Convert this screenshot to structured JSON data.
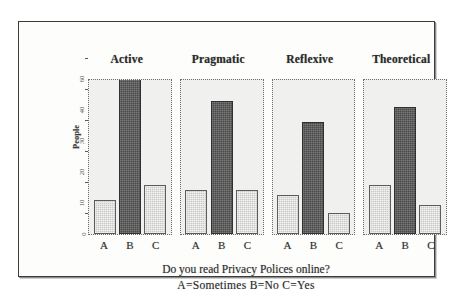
{
  "chart_data": {
    "type": "bar",
    "title": "",
    "panels": [
      "Active",
      "Pragmatic",
      "Reflexive",
      "Theoretical"
    ],
    "categories": [
      "A",
      "B",
      "C"
    ],
    "series": [
      {
        "name": "Active",
        "values": [
          13,
          60,
          19
        ]
      },
      {
        "name": "Pragmatic",
        "values": [
          17,
          51,
          17
        ]
      },
      {
        "name": "Reflexive",
        "values": [
          15,
          43,
          8
        ]
      },
      {
        "name": "Theoretical",
        "values": [
          19,
          49,
          11
        ]
      }
    ],
    "xlabel": "Do you read Privacy Polices online?",
    "ylabel": "People",
    "ylim": [
      0,
      60
    ],
    "yticks": [
      0,
      10,
      20,
      30,
      40,
      60
    ],
    "ytick_labels": [
      "0",
      "10",
      "20",
      "30",
      "40",
      "60"
    ],
    "grid": false,
    "legend_position": "below-axis",
    "legend_text": "A=Sometimes  B=No  C=Yes",
    "bar_colors": {
      "light": "#c9c9c7",
      "dark": "#4a4a4a"
    }
  },
  "caption": {
    "question": "Do you read Privacy Polices online?",
    "legend": "A=Sometimes   B=No   C=Yes"
  },
  "axis": {
    "y_title": "People"
  }
}
